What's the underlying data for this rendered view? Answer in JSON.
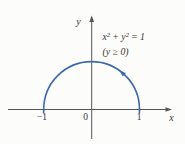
{
  "diagram": {
    "type": "math-figure",
    "equation": {
      "line1": "x² + y² = 1",
      "line2": "(y ≥ 0)"
    },
    "axis_labels": {
      "x": "x",
      "y": "y"
    },
    "tick_labels": {
      "neg_one": "−1",
      "zero": "0",
      "one": "1"
    },
    "curve": {
      "shape": "semicircle",
      "center": [
        0,
        0
      ],
      "radius": 1,
      "constraint": "y ≥ 0",
      "direction": "counterclockwise",
      "endpoints": [
        [
          -1,
          0
        ],
        [
          1,
          0
        ]
      ]
    },
    "colors": {
      "curve": "#3e68ad",
      "axis": "#565656",
      "text": "#353535",
      "background": "#fcfcfa"
    }
  }
}
